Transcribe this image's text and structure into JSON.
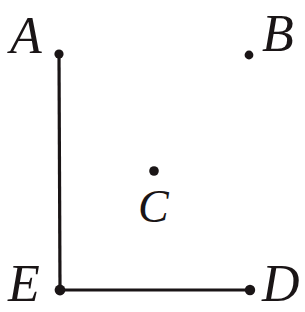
{
  "figure": {
    "background_color": "#ffffff",
    "ink_color": "#1a1516",
    "width": 305,
    "height": 312,
    "points": [
      {
        "label": "A",
        "name": "point-a",
        "dot": {
          "cx": 59,
          "cy": 54,
          "r": 4.6
        },
        "label_pos": {
          "x": 10,
          "y": 10
        },
        "label_size": 52
      },
      {
        "label": "B",
        "name": "point-b",
        "dot": {
          "cx": 249,
          "cy": 55,
          "r": 4.4
        },
        "label_pos": {
          "x": 262,
          "y": 8
        },
        "label_size": 52
      },
      {
        "label": "C",
        "name": "point-c",
        "dot": {
          "cx": 154,
          "cy": 171,
          "r": 4.8
        },
        "label_pos": {
          "x": 138,
          "y": 184
        },
        "label_size": 46
      },
      {
        "label": "D",
        "name": "point-d",
        "dot": {
          "cx": 250,
          "cy": 290,
          "r": 5.2
        },
        "label_pos": {
          "x": 262,
          "y": 258
        },
        "label_size": 52
      },
      {
        "label": "E",
        "name": "point-e",
        "dot": {
          "cx": 60,
          "cy": 290,
          "r": 5.4
        },
        "label_pos": {
          "x": 8,
          "y": 258
        },
        "label_size": 52
      }
    ],
    "segments": [
      {
        "name": "segment-ea",
        "from": "A",
        "to": "E",
        "x1": 59,
        "y1": 54,
        "x2": 60,
        "y2": 290,
        "stroke_width": 3.2
      },
      {
        "name": "segment-ed",
        "from": "E",
        "to": "D",
        "x1": 60,
        "y1": 290,
        "x2": 250,
        "y2": 290,
        "stroke_width": 3.0
      }
    ]
  }
}
